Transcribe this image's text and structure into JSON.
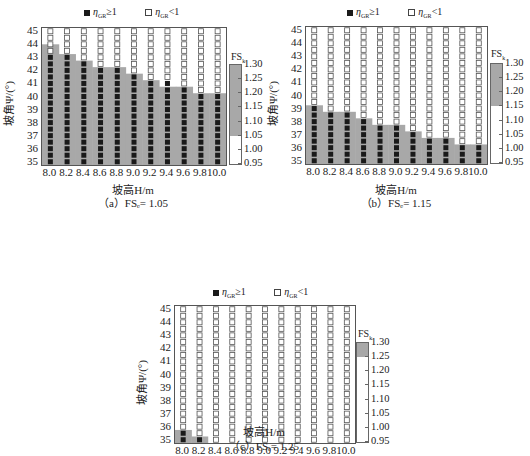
{
  "legend": {
    "filled_label": "η",
    "filled_sub": "GR",
    "filled_rel": "≥1",
    "hollow_label": "η",
    "hollow_sub": "GR",
    "hollow_rel": "<1"
  },
  "axes": {
    "xlabel": "坡高H/m",
    "ylabel": "坡角Ψ/(°)",
    "x_ticks": [
      "8.0",
      "8.2",
      "8.4",
      "8.6",
      "8.8",
      "9.0",
      "9.2",
      "9.4",
      "9.6",
      "9.8",
      "10.0"
    ],
    "y_ticks": [
      "45",
      "44",
      "43",
      "42",
      "41",
      "40",
      "39",
      "38",
      "37",
      "36",
      "35"
    ]
  },
  "colorbar": {
    "title": "FS",
    "title_sub": "k",
    "ticks": [
      "1.30",
      "1.25",
      "1.20",
      "1.15",
      "1.10",
      "1.05",
      "1.00",
      "0.95"
    ],
    "fill_color": "#a8a8a8"
  },
  "panels": [
    {
      "caption": "（a）FSₑ= 1.05",
      "fs_threshold": 1.05
    },
    {
      "caption": "（b）FSₑ= 1.15",
      "fs_threshold": 1.15
    },
    {
      "caption": "（c）FSₑ= 1.25",
      "fs_threshold": 1.25
    }
  ],
  "chart_data": [
    {
      "type": "heatmap",
      "title": "(a) FSe = 1.05",
      "xlabel": "坡高 H/m",
      "ylabel": "坡角 Ψ/(°)",
      "x": [
        8.0,
        8.2,
        8.4,
        8.6,
        8.8,
        9.0,
        9.2,
        9.4,
        9.6,
        9.8,
        10.0
      ],
      "y_range": [
        35,
        45
      ],
      "y_step": 0.5,
      "max_angle_eta_ge_1": [
        43.0,
        43.0,
        42.5,
        42.0,
        42.0,
        41.5,
        41.0,
        41.0,
        40.5,
        40.0,
        40.0
      ],
      "max_angle_shaded_fs_ge_fse": [
        43.5,
        43.0,
        42.5,
        42.0,
        42.0,
        41.5,
        41.0,
        40.5,
        40.5,
        40.0,
        40.0
      ],
      "legend": [
        "η_GR ≥ 1 (filled)",
        "η_GR < 1 (hollow)"
      ],
      "colorbar": {
        "label": "FS_k",
        "range": [
          0.95,
          1.3
        ],
        "shaded_above": 1.05
      }
    },
    {
      "type": "heatmap",
      "title": "(b) FSe = 1.15",
      "xlabel": "坡高 H/m",
      "ylabel": "坡角 Ψ/(°)",
      "x": [
        8.0,
        8.2,
        8.4,
        8.6,
        8.8,
        9.0,
        9.2,
        9.4,
        9.6,
        9.8,
        10.0
      ],
      "y_range": [
        35,
        45
      ],
      "y_step": 0.5,
      "max_angle_eta_ge_1": [
        39.0,
        38.5,
        38.5,
        38.0,
        37.5,
        37.5,
        37.0,
        36.5,
        36.5,
        36.0,
        36.0
      ],
      "max_angle_shaded_fs_ge_fse": [
        39.0,
        38.5,
        38.5,
        38.0,
        37.5,
        37.5,
        37.0,
        36.5,
        36.5,
        36.0,
        36.0
      ],
      "legend": [
        "η_GR ≥ 1 (filled)",
        "η_GR < 1 (hollow)"
      ],
      "colorbar": {
        "label": "FS_k",
        "range": [
          0.95,
          1.3
        ],
        "shaded_above": 1.15
      }
    },
    {
      "type": "heatmap",
      "title": "(c) FSe = 1.25",
      "xlabel": "坡高 H/m",
      "ylabel": "坡角 Ψ/(°)",
      "x": [
        8.0,
        8.2,
        8.4,
        8.6,
        8.8,
        9.0,
        9.2,
        9.4,
        9.6,
        9.8,
        10.0
      ],
      "y_range": [
        35,
        45
      ],
      "y_step": 0.5,
      "max_angle_eta_ge_1": [
        35.5,
        35.0,
        null,
        null,
        null,
        null,
        null,
        null,
        null,
        null,
        null
      ],
      "max_angle_shaded_fs_ge_fse": [
        35.5,
        35.0,
        null,
        null,
        null,
        null,
        null,
        null,
        null,
        null,
        null
      ],
      "legend": [
        "η_GR ≥ 1 (filled)",
        "η_GR < 1 (hollow)"
      ],
      "colorbar": {
        "label": "FS_k",
        "range": [
          0.95,
          1.3
        ],
        "shaded_above": 1.25
      }
    }
  ]
}
